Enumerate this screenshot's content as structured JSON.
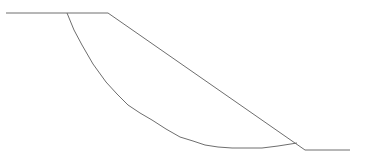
{
  "diagram": {
    "type": "slope-stability-section",
    "stroke_color": "#6e6e6e",
    "ground_profile": [
      [
        6,
        13
      ],
      [
        108,
        13
      ],
      [
        305,
        150
      ],
      [
        350,
        150
      ]
    ],
    "slip_surface": [
      [
        67,
        13
      ],
      [
        74,
        30
      ],
      [
        82,
        45
      ],
      [
        93,
        64
      ],
      [
        106,
        82
      ],
      [
        117,
        94
      ],
      [
        128,
        105
      ],
      [
        140,
        113
      ],
      [
        152,
        120
      ],
      [
        166,
        129
      ],
      [
        180,
        137
      ],
      [
        193,
        141
      ],
      [
        205,
        145
      ],
      [
        218,
        147
      ],
      [
        232,
        148
      ],
      [
        247,
        148
      ],
      [
        262,
        148
      ],
      [
        278,
        146
      ],
      [
        297,
        143
      ]
    ]
  }
}
